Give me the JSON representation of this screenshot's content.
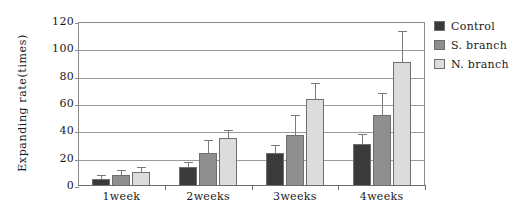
{
  "chart_data": {
    "type": "bar",
    "title": "",
    "xlabel": "",
    "ylabel": "Expanding rate(times)",
    "categories": [
      "1week",
      "2weeks",
      "3weeks",
      "4weeks"
    ],
    "ylim": [
      0,
      120
    ],
    "yticks": [
      0,
      20,
      40,
      60,
      80,
      100,
      120
    ],
    "grid": true,
    "legend_position": "right",
    "series": [
      {
        "name": "Control",
        "color": "#3a3a3a",
        "values": [
          5,
          14,
          24,
          31
        ],
        "errors": [
          2,
          3,
          5,
          6
        ]
      },
      {
        "name": "S. branch",
        "color": "#8f8f8f",
        "values": [
          8,
          24,
          37,
          52
        ],
        "errors": [
          3,
          9,
          14,
          15
        ]
      },
      {
        "name": "N. branch",
        "color": "#dcdcdc",
        "values": [
          10,
          35,
          64,
          91
        ],
        "errors": [
          3,
          5,
          11,
          22
        ]
      }
    ]
  },
  "legend": {
    "items": [
      {
        "label": "Control",
        "color": "#3a3a3a"
      },
      {
        "label": "S. branch",
        "color": "#8f8f8f"
      },
      {
        "label": "N. branch",
        "color": "#dcdcdc"
      }
    ]
  },
  "colors": {
    "axis": "#8a8a8a",
    "grid": "#9a9a9a",
    "text": "#1a1a1a",
    "error_bar": "#7a7a7a",
    "bar_outline": "#6f6f6f",
    "background": "#ffffff"
  }
}
